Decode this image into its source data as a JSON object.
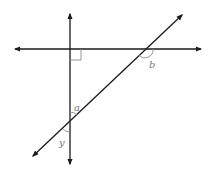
{
  "diagram": {
    "colors": {
      "line": "#1a1a1a",
      "mark": "#8a8a8a",
      "label": "#7a7a7a",
      "background": "#ffffff"
    },
    "lines": [
      {
        "id": "horizontal",
        "from": [
          15,
          49
        ],
        "to": [
          201,
          49
        ],
        "arrows": "both"
      },
      {
        "id": "vertical",
        "from": [
          70,
          14
        ],
        "to": [
          70,
          164
        ],
        "arrows": "both"
      },
      {
        "id": "transversal",
        "from": [
          33,
          156
        ],
        "to": [
          182,
          15
        ],
        "arrows": "both"
      }
    ],
    "right_angle": {
      "at": [
        70,
        49
      ],
      "size": 11,
      "quadrant": "below-right"
    },
    "angles": [
      {
        "name": "a",
        "label": "a",
        "vertex": [
          70,
          122
        ],
        "position": "above-right"
      },
      {
        "name": "y",
        "label": "y",
        "vertex": [
          70,
          122
        ],
        "position": "below-left"
      },
      {
        "name": "b",
        "label": "b",
        "vertex": [
          145,
          49
        ],
        "position": "below-right"
      }
    ]
  }
}
